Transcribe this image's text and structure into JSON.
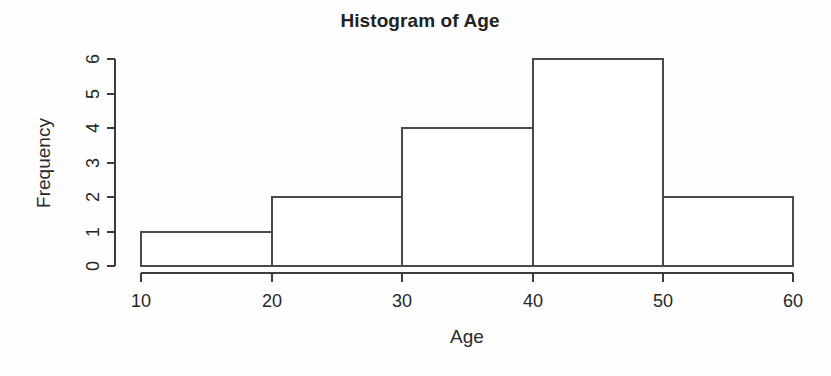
{
  "chart_data": {
    "type": "bar",
    "title": "Histogram of Age",
    "xlabel": "Age",
    "ylabel": "Frequency",
    "categories": [
      "10-20",
      "20-30",
      "30-40",
      "40-50",
      "50-60"
    ],
    "bin_edges": [
      10,
      20,
      30,
      40,
      50,
      60
    ],
    "values": [
      1,
      2,
      4,
      6,
      2
    ],
    "xlim": [
      10,
      60
    ],
    "ylim": [
      0,
      6
    ],
    "xticks": [
      "10",
      "20",
      "30",
      "40",
      "50",
      "60"
    ],
    "yticks": [
      "0",
      "1",
      "2",
      "3",
      "4",
      "5",
      "6"
    ],
    "grid": false,
    "legend": false,
    "bar_fill": "#ffffff",
    "bar_stroke": "#4a4a4a",
    "axis_color": "#3c3c3c",
    "background": "#fefefe",
    "bars": [
      {
        "label": "10-20",
        "x0": 10,
        "x1": 20,
        "value": 1
      },
      {
        "label": "20-30",
        "x0": 20,
        "x1": 30,
        "value": 2
      },
      {
        "label": "30-40",
        "x0": 30,
        "x1": 40,
        "value": 4
      },
      {
        "label": "40-50",
        "x0": 40,
        "x1": 50,
        "value": 6
      },
      {
        "label": "50-60",
        "x0": 50,
        "x1": 60,
        "value": 2
      }
    ]
  },
  "axes": {
    "x": {
      "ticks": [
        {
          "value": "10",
          "px": 141
        },
        {
          "value": "20",
          "px": 272
        },
        {
          "value": "30",
          "px": 402
        },
        {
          "value": "40",
          "px": 533
        },
        {
          "value": "50",
          "px": 663
        },
        {
          "value": "60",
          "px": 793
        }
      ]
    },
    "y": {
      "ticks": [
        {
          "value": "6",
          "px": 59
        },
        {
          "value": "5",
          "px": 94
        },
        {
          "value": "4",
          "px": 128
        },
        {
          "value": "3",
          "px": 163
        },
        {
          "value": "2",
          "px": 197
        },
        {
          "value": "1",
          "px": 232
        },
        {
          "value": "0",
          "px": 266
        }
      ]
    }
  }
}
